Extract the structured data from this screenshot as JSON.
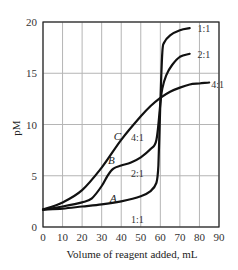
{
  "chart_data": {
    "type": "line",
    "title": "",
    "xlabel": "Volume of reagent added, mL",
    "ylabel": "pM",
    "xlim": [
      0,
      90
    ],
    "ylim": [
      0,
      20
    ],
    "xticks": [
      0,
      10,
      20,
      30,
      40,
      50,
      60,
      70,
      80,
      90
    ],
    "yticks": [
      0,
      5,
      10,
      15,
      20
    ],
    "grid": true,
    "legend": "inline labels",
    "series": [
      {
        "name": "A",
        "ratio_label": "1:1",
        "x": [
          0,
          10,
          20,
          30,
          40,
          50,
          55,
          58,
          59,
          60,
          61,
          62,
          65,
          70,
          75
        ],
        "y": [
          1.7,
          1.8,
          2.0,
          2.2,
          2.5,
          3.0,
          3.5,
          4.3,
          6.0,
          12.0,
          17.0,
          18.0,
          18.7,
          19.2,
          19.4
        ]
      },
      {
        "name": "B",
        "ratio_label": "2:1",
        "x": [
          0,
          10,
          20,
          25,
          30,
          33,
          36,
          40,
          45,
          50,
          55,
          58,
          60,
          61,
          63,
          66,
          70,
          75
        ],
        "y": [
          1.7,
          2.0,
          2.4,
          2.8,
          4.0,
          5.0,
          5.7,
          6.0,
          6.3,
          6.8,
          7.6,
          8.5,
          12.0,
          13.5,
          14.8,
          15.8,
          16.6,
          16.9
        ]
      },
      {
        "name": "C",
        "ratio_label": "4:1",
        "x": [
          0,
          10,
          20,
          30,
          40,
          50,
          55,
          60,
          65,
          70,
          75,
          80,
          85
        ],
        "y": [
          1.7,
          2.4,
          3.6,
          5.8,
          8.5,
          10.8,
          11.8,
          12.6,
          13.2,
          13.6,
          13.9,
          14.0,
          14.1
        ]
      }
    ],
    "annotations": [
      {
        "text": "C",
        "x": 38,
        "y": 8.9
      },
      {
        "text": "4:1",
        "x": 45,
        "y": 8.8
      },
      {
        "text": "B",
        "x": 35,
        "y": 6.5
      },
      {
        "text": "2:1",
        "x": 45,
        "y": 5.3
      },
      {
        "text": "A",
        "x": 36,
        "y": 2.8
      },
      {
        "text": "1:1",
        "x": 45,
        "y": 0.8
      },
      {
        "text": "1:1",
        "x": 79,
        "y": 19.4
      },
      {
        "text": "2:1",
        "x": 79,
        "y": 16.9
      },
      {
        "text": "4:1",
        "x": 86,
        "y": 14.0
      }
    ]
  }
}
